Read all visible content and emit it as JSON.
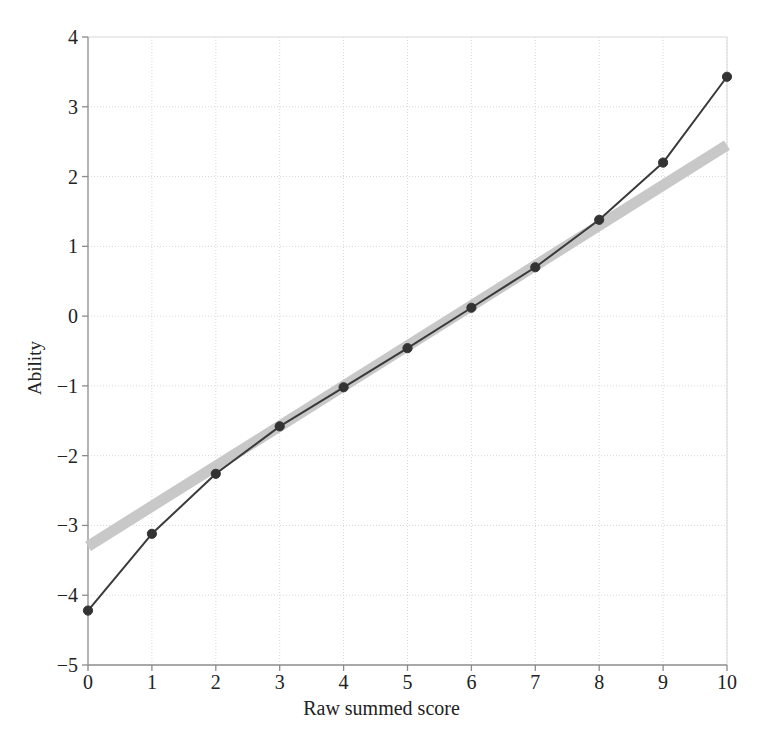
{
  "chart_data": {
    "type": "line",
    "title": "",
    "subtitle": "",
    "xlabel": "Raw summed score",
    "ylabel": "Ability",
    "xlim": [
      0,
      10
    ],
    "ylim": [
      -5,
      4
    ],
    "xticks": [
      "0",
      "1",
      "2",
      "3",
      "4",
      "5",
      "6",
      "7",
      "8",
      "9",
      "10"
    ],
    "yticks": [
      "4",
      "3",
      "2",
      "1",
      "0",
      "-1",
      "-2",
      "-3",
      "-4",
      "-5"
    ],
    "grid": true,
    "legend": "none",
    "x": [
      0,
      1,
      2,
      3,
      4,
      5,
      6,
      7,
      8,
      9,
      10
    ],
    "series": [
      {
        "name": "Estimated ability",
        "style": "line-with-markers",
        "color": "#3a3a3a",
        "marker": "circle",
        "values": [
          -4.22,
          -3.12,
          -2.26,
          -1.58,
          -1.02,
          -0.46,
          0.12,
          0.7,
          1.38,
          2.2,
          3.43
        ]
      },
      {
        "name": "Linear reference band",
        "style": "thick-band",
        "color": "#c8c8c8",
        "marker": "none",
        "endpoints": [
          [
            0,
            -3.3
          ],
          [
            10,
            2.45
          ]
        ],
        "values": [
          -3.3,
          -2.725,
          -2.15,
          -1.575,
          -1.0,
          -0.425,
          0.15,
          0.725,
          1.3,
          1.875,
          2.45
        ]
      }
    ]
  },
  "colors": {
    "background": "#ffffff",
    "axis": "#8c8c8c",
    "grid": "#d8d8d8",
    "line": "#3a3a3a",
    "marker": "#333333",
    "band": "#c9c9c9",
    "text": "#222222"
  }
}
